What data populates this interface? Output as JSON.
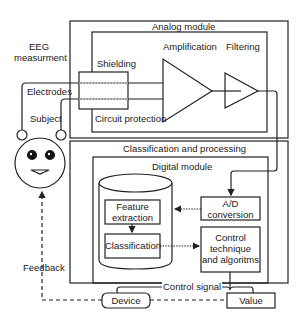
{
  "diagram": {
    "eeg_label": [
      "EEG",
      "measurment"
    ],
    "analog_module": {
      "title": "Analog module",
      "shielding": "Shielding",
      "circuit_protection": "Circuit protection",
      "amplification": "Amplification",
      "filtering": "Filtering"
    },
    "left": {
      "electrodes": "Electrodes",
      "subject": "Subject",
      "feedback": "Feedback"
    },
    "classification_processing": {
      "title": "Classification and processing",
      "digital_module": "Digital module",
      "feature_extraction": [
        "Feature",
        "extraction"
      ],
      "classification": "Classification",
      "ad_conversion": [
        "A/D",
        "conversion"
      ],
      "control_technique": [
        "Control",
        "technique",
        "and algoritms"
      ]
    },
    "bottom": {
      "control_signal": "Control signal",
      "device": "Device",
      "value": "Value"
    },
    "colors": {
      "line": "#222222",
      "background": "#ffffff"
    }
  }
}
